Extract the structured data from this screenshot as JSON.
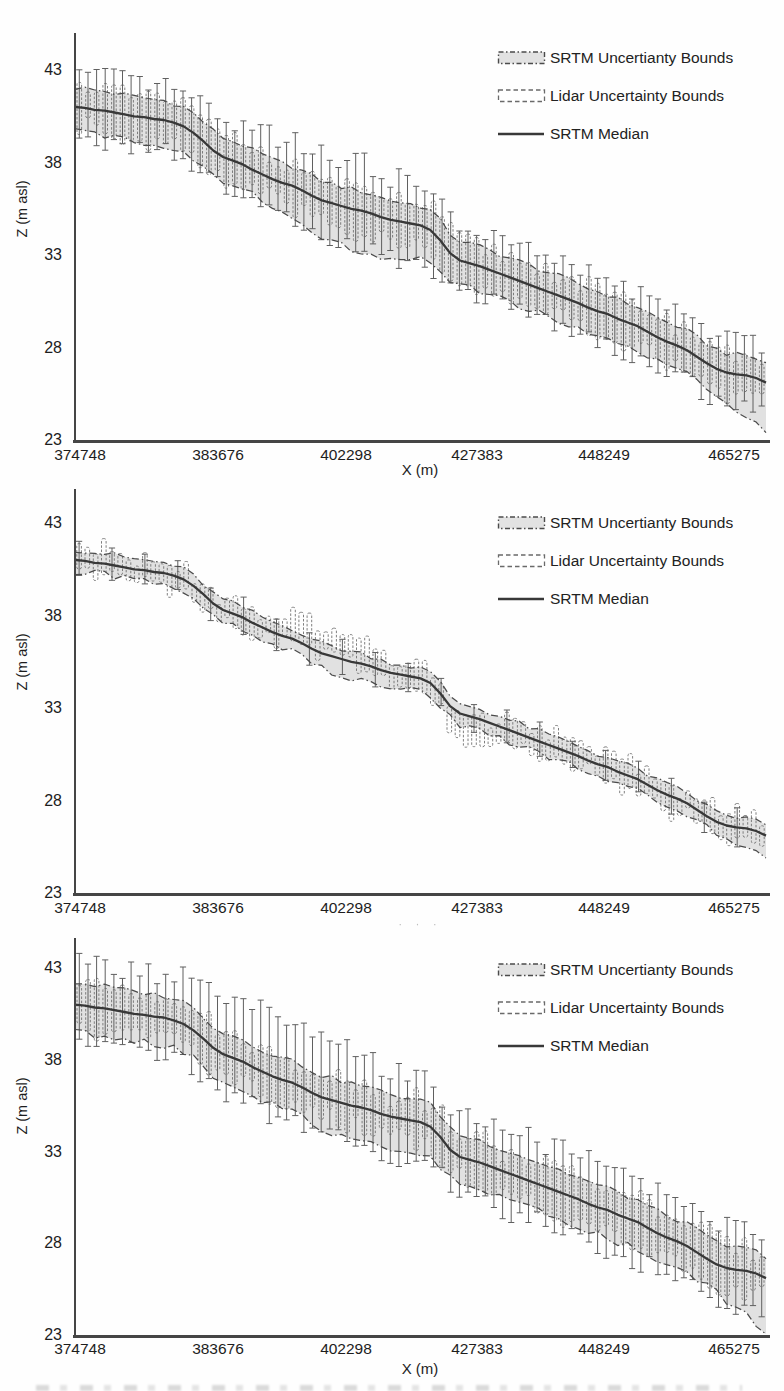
{
  "colors": {
    "median_line": "#383838",
    "band_fill": "#d9d9d9",
    "band_edge": "#4b4b4b",
    "whisker": "#5f5f5f",
    "box_edge": "#707070",
    "axis": "#454545",
    "text": "#1d1d1d"
  },
  "chart_data": [
    {
      "type": "line",
      "title": "",
      "xlabel": "X (m)",
      "ylabel": "Z (m asl)",
      "x_tick_labels": [
        "374748",
        "383676",
        "402298",
        "427383",
        "448249",
        "465275"
      ],
      "y_tick_labels": [
        "43",
        "38",
        "33",
        "28",
        "23"
      ],
      "ylim": [
        23,
        45
      ],
      "grid": false,
      "legend_position": "top-right",
      "legend": [
        "SRTM Uncertianty Bounds",
        "Lidar Uncertainty Bounds",
        "SRTM Median"
      ],
      "series": [
        {
          "name": "SRTM Median",
          "values": [
            41.0,
            40.95,
            40.85,
            40.8,
            40.7,
            40.6,
            40.5,
            40.45,
            40.35,
            40.3,
            40.15,
            39.95,
            39.6,
            39.15,
            38.65,
            38.3,
            38.1,
            37.9,
            37.6,
            37.35,
            37.1,
            36.9,
            36.75,
            36.5,
            36.2,
            35.95,
            35.8,
            35.65,
            35.5,
            35.4,
            35.25,
            35.05,
            34.9,
            34.8,
            34.7,
            34.6,
            34.35,
            33.8,
            33.1,
            32.7,
            32.55,
            32.4,
            32.2,
            32.0,
            31.8,
            31.6,
            31.4,
            31.2,
            31.0,
            30.8,
            30.6,
            30.4,
            30.15,
            29.95,
            29.8,
            29.55,
            29.35,
            29.15,
            28.85,
            28.55,
            28.3,
            28.1,
            27.85,
            27.5,
            27.15,
            26.85,
            26.65,
            26.55,
            26.5,
            26.35,
            26.1
          ]
        }
      ],
      "uncertainty": {
        "srtm_band_above_m": 1.05,
        "srtm_band_below_m": 1.35,
        "band_extra_below": {
          "from": 0.28,
          "to": 0.55,
          "m": 0.8
        },
        "end_dip_m": 1.3,
        "lidar_box_halfwidth_m": 1.15,
        "lidar_whisker_above_m": 1.85,
        "lidar_whisker_below_m": 1.7,
        "whisker_extra_above": {
          "from": 0.2,
          "to": 0.55,
          "m": 0.8
        },
        "whisker_extra_below": {
          "from": 0.3,
          "to": 0.58,
          "m": 0.5
        },
        "error_bar_count": 80,
        "whisker_every": 1,
        "box_dy_jitter_m": 0.4,
        "box_offset_regions": []
      }
    },
    {
      "type": "line",
      "title": "",
      "xlabel": "· · ·",
      "xlabel_style": "faded",
      "ylabel": "Z (m asl)",
      "x_tick_labels": [
        "374748",
        "383676",
        "402298",
        "427383",
        "448249",
        "465275"
      ],
      "y_tick_labels": [
        "43",
        "38",
        "33",
        "28",
        "23"
      ],
      "ylim": [
        23,
        45
      ],
      "grid": false,
      "legend_position": "top-right",
      "legend": [
        "SRTM Uncertianty Bounds",
        "Lidar Uncertainty Bounds",
        "SRTM Median"
      ],
      "series": [
        {
          "name": "SRTM Median",
          "values": [
            41.0,
            40.95,
            40.85,
            40.8,
            40.7,
            40.6,
            40.5,
            40.45,
            40.35,
            40.3,
            40.15,
            39.95,
            39.6,
            39.15,
            38.65,
            38.3,
            38.1,
            37.9,
            37.6,
            37.35,
            37.1,
            36.9,
            36.75,
            36.5,
            36.2,
            35.95,
            35.8,
            35.65,
            35.5,
            35.4,
            35.25,
            35.05,
            34.9,
            34.8,
            34.7,
            34.6,
            34.35,
            33.8,
            33.1,
            32.7,
            32.55,
            32.4,
            32.2,
            32.0,
            31.8,
            31.6,
            31.4,
            31.2,
            31.0,
            30.8,
            30.6,
            30.4,
            30.15,
            29.95,
            29.8,
            29.55,
            29.35,
            29.15,
            28.85,
            28.55,
            28.3,
            28.1,
            27.85,
            27.5,
            27.15,
            26.85,
            26.65,
            26.55,
            26.5,
            26.35,
            26.1
          ]
        }
      ],
      "uncertainty": {
        "srtm_band_above_m": 0.55,
        "srtm_band_below_m": 0.6,
        "band_extra_below": {
          "from": 0.3,
          "to": 0.52,
          "m": 0.3
        },
        "end_dip_m": 0.7,
        "lidar_box_halfwidth_m": 0.7,
        "lidar_whisker_above_m": 0.9,
        "lidar_whisker_below_m": 0.85,
        "whisker_extra_above": null,
        "whisker_extra_below": null,
        "error_bar_count": 84,
        "whisker_every": 4,
        "box_dy_jitter_m": 0.8,
        "box_offset_regions": [
          {
            "from": 0.28,
            "to": 0.47,
            "dy": 0.75
          },
          {
            "from": 0.52,
            "to": 0.63,
            "dy": -0.8
          }
        ]
      }
    },
    {
      "type": "line",
      "title": "",
      "xlabel": "X (m)",
      "ylabel": "Z (m asl)",
      "x_tick_labels": [
        "374748",
        "383676",
        "402298",
        "427383",
        "448249",
        "465275"
      ],
      "y_tick_labels": [
        "43",
        "38",
        "33",
        "28",
        "23"
      ],
      "ylim": [
        23,
        45
      ],
      "grid": false,
      "legend_position": "top-right",
      "legend": [
        "SRTM Uncertianty Bounds",
        "Lidar Uncertainty Bounds",
        "SRTM Median"
      ],
      "series": [
        {
          "name": "SRTM Median",
          "values": [
            41.0,
            40.95,
            40.85,
            40.8,
            40.7,
            40.6,
            40.5,
            40.45,
            40.35,
            40.3,
            40.15,
            39.95,
            39.6,
            39.15,
            38.65,
            38.3,
            38.1,
            37.9,
            37.6,
            37.35,
            37.1,
            36.9,
            36.75,
            36.5,
            36.2,
            35.95,
            35.8,
            35.65,
            35.5,
            35.4,
            35.25,
            35.05,
            34.9,
            34.8,
            34.7,
            34.6,
            34.35,
            33.8,
            33.1,
            32.7,
            32.55,
            32.4,
            32.2,
            32.0,
            31.8,
            31.6,
            31.4,
            31.2,
            31.0,
            30.8,
            30.6,
            30.4,
            30.15,
            29.95,
            29.8,
            29.55,
            29.35,
            29.15,
            28.85,
            28.55,
            28.3,
            28.1,
            27.85,
            27.5,
            27.15,
            26.85,
            26.65,
            26.55,
            26.5,
            26.35,
            26.1
          ]
        }
      ],
      "uncertainty": {
        "srtm_band_above_m": 1.2,
        "srtm_band_below_m": 1.5,
        "band_extra_below": {
          "from": 0.3,
          "to": 0.55,
          "m": 0.4
        },
        "end_dip_m": 1.5,
        "lidar_box_halfwidth_m": 1.25,
        "lidar_whisker_above_m": 2.35,
        "lidar_whisker_below_m": 2.1,
        "whisker_extra_above": {
          "from": 0.12,
          "to": 0.5,
          "m": 0.8
        },
        "whisker_extra_below": null,
        "error_bar_count": 80,
        "whisker_every": 1,
        "box_dy_jitter_m": 0.5,
        "box_offset_regions": []
      }
    }
  ]
}
